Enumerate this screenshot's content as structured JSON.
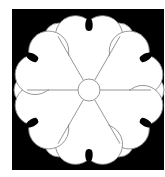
{
  "image": {
    "title": "Six-petal flower crest",
    "width": 165,
    "height": 177,
    "background_color": "#ffffff"
  },
  "crest": {
    "frame": {
      "x": 12,
      "y": 9,
      "width": 152,
      "height": 161,
      "color": "#000000"
    },
    "center": {
      "x": 89,
      "y": 90
    },
    "petal_count": 6,
    "petal_axis_start_deg": -90,
    "petal_fill": "#ffffff",
    "outline_color": "#8a8a8a",
    "outline_width": 0.9,
    "petal_lobe": {
      "radial_distance": 56,
      "angle_offset_deg": 14,
      "radius": 20
    },
    "background_lobe": {
      "radial_distance": 60,
      "radius": 15
    },
    "inner_disk_radius": 58,
    "center_circle": {
      "radius": 11
    },
    "notch": {
      "inner_radius": 59,
      "outer_radius": 76,
      "bulb_width": 8,
      "bulb_length": 13,
      "neck_width": 3,
      "color": "#000000"
    }
  }
}
